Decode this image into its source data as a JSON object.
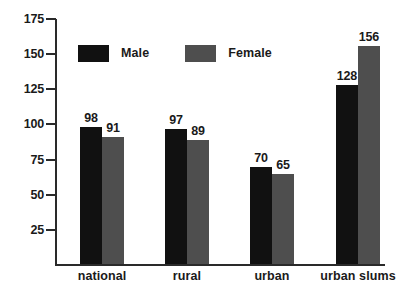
{
  "chart_data": {
    "type": "bar",
    "title": "",
    "subtitle": "",
    "xlabel": "",
    "ylabel": "",
    "categories": [
      "national",
      "rural",
      "urban",
      "urban slums"
    ],
    "series": [
      {
        "name": "Male",
        "color": "#111111",
        "values": [
          98,
          97,
          70,
          128
        ]
      },
      {
        "name": "Female",
        "color": "#4e4e4e",
        "values": [
          91,
          89,
          65,
          156
        ]
      }
    ],
    "value_labels": [
      "98",
      "91",
      "97",
      "89",
      "70",
      "65",
      "128",
      "156"
    ],
    "ylim": [
      0,
      175
    ],
    "yticks": [
      25,
      50,
      75,
      100,
      125,
      150,
      175
    ],
    "ytick_labels": [
      "25",
      "50",
      "75",
      "100",
      "125",
      "150",
      "175"
    ],
    "grid": false,
    "legend": {
      "position": "top-left",
      "entries": [
        "Male",
        "Female"
      ]
    }
  },
  "axis": {
    "y": {
      "ticks": [
        {
          "label": "175",
          "value": 175
        },
        {
          "label": "150",
          "value": 150
        },
        {
          "label": "125",
          "value": 125
        },
        {
          "label": "100",
          "value": 100
        },
        {
          "label": "75",
          "value": 75
        },
        {
          "label": "50",
          "value": 50
        },
        {
          "label": "25",
          "value": 25
        }
      ]
    },
    "x": {
      "labels": [
        "national",
        "rural",
        "urban",
        "urban slums"
      ]
    }
  },
  "legend": {
    "items": [
      {
        "label": "Male",
        "color": "#111111"
      },
      {
        "label": "Female",
        "color": "#4e4e4e"
      }
    ]
  },
  "bars": [
    {
      "group": "national",
      "series": "Male",
      "value": 98,
      "label": "98"
    },
    {
      "group": "national",
      "series": "Female",
      "value": 91,
      "label": "91"
    },
    {
      "group": "rural",
      "series": "Male",
      "value": 97,
      "label": "97"
    },
    {
      "group": "rural",
      "series": "Female",
      "value": 89,
      "label": "89"
    },
    {
      "group": "urban",
      "series": "Male",
      "value": 70,
      "label": "70"
    },
    {
      "group": "urban",
      "series": "Female",
      "value": 65,
      "label": "65"
    },
    {
      "group": "urban slums",
      "series": "Male",
      "value": 128,
      "label": "128"
    },
    {
      "group": "urban slums",
      "series": "Female",
      "value": 156,
      "label": "156"
    }
  ]
}
